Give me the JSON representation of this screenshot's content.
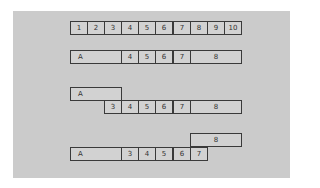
{
  "diagram": {
    "rows": [
      {
        "id": "row1",
        "cells": [
          {
            "label": "1",
            "x": 70,
            "y": 21,
            "w": 18
          },
          {
            "label": "2",
            "x": 87,
            "y": 21,
            "w": 18
          },
          {
            "label": "3",
            "x": 104,
            "y": 21,
            "w": 18
          },
          {
            "label": "4",
            "x": 121,
            "y": 21,
            "w": 18
          },
          {
            "label": "5",
            "x": 138,
            "y": 21,
            "w": 18
          },
          {
            "label": "6",
            "x": 155,
            "y": 21,
            "w": 18
          },
          {
            "label": "7",
            "x": 173,
            "y": 21,
            "w": 18
          },
          {
            "label": "8",
            "x": 190,
            "y": 21,
            "w": 18
          },
          {
            "label": "9",
            "x": 207,
            "y": 21,
            "w": 18
          },
          {
            "label": "10",
            "x": 224,
            "y": 21,
            "w": 18
          }
        ]
      },
      {
        "id": "row2",
        "cells": [
          {
            "label": "A",
            "x": 70,
            "y": 50,
            "w": 52,
            "align": "left"
          },
          {
            "label": "4",
            "x": 121,
            "y": 50,
            "w": 18
          },
          {
            "label": "5",
            "x": 138,
            "y": 50,
            "w": 18
          },
          {
            "label": "6",
            "x": 155,
            "y": 50,
            "w": 18
          },
          {
            "label": "7",
            "x": 173,
            "y": 50,
            "w": 18
          },
          {
            "label": "8",
            "x": 190,
            "y": 50,
            "w": 52
          }
        ]
      },
      {
        "id": "row3",
        "cells": [
          {
            "label": "A",
            "x": 70,
            "y": 87,
            "w": 52,
            "align": "left"
          },
          {
            "label": "3",
            "x": 104,
            "y": 100,
            "w": 18
          },
          {
            "label": "4",
            "x": 121,
            "y": 100,
            "w": 18
          },
          {
            "label": "5",
            "x": 138,
            "y": 100,
            "w": 18
          },
          {
            "label": "6",
            "x": 155,
            "y": 100,
            "w": 18
          },
          {
            "label": "7",
            "x": 173,
            "y": 100,
            "w": 18
          },
          {
            "label": "8",
            "x": 190,
            "y": 100,
            "w": 52
          }
        ]
      },
      {
        "id": "row4",
        "cells": [
          {
            "label": "8",
            "x": 190,
            "y": 133,
            "w": 52
          },
          {
            "label": "A",
            "x": 70,
            "y": 147,
            "w": 52,
            "align": "left"
          },
          {
            "label": "3",
            "x": 121,
            "y": 147,
            "w": 18
          },
          {
            "label": "4",
            "x": 138,
            "y": 147,
            "w": 18
          },
          {
            "label": "5",
            "x": 155,
            "y": 147,
            "w": 18
          },
          {
            "label": "6",
            "x": 173,
            "y": 147,
            "w": 18
          },
          {
            "label": "7",
            "x": 190,
            "y": 147,
            "w": 18
          }
        ]
      }
    ]
  }
}
